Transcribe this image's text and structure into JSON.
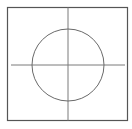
{
  "diagram": {
    "frame": {
      "x": 7.5,
      "y": 7.5,
      "width": 120,
      "height": 113,
      "stroke": "#555555",
      "stroke_width": 1.2
    },
    "circle": {
      "cx": 68,
      "cy": 65,
      "r": 36,
      "stroke": "#6a6a6a",
      "stroke_width": 1
    },
    "horizontal_axis": {
      "x1": 11,
      "y1": 65,
      "x2": 125,
      "y2": 65,
      "stroke": "#7a7a7a"
    },
    "vertical_axis": {
      "x1": 68,
      "y1": 7.5,
      "x2": 68,
      "y2": 120.5,
      "stroke": "#7a7a7a"
    },
    "background": "#ffffff"
  }
}
